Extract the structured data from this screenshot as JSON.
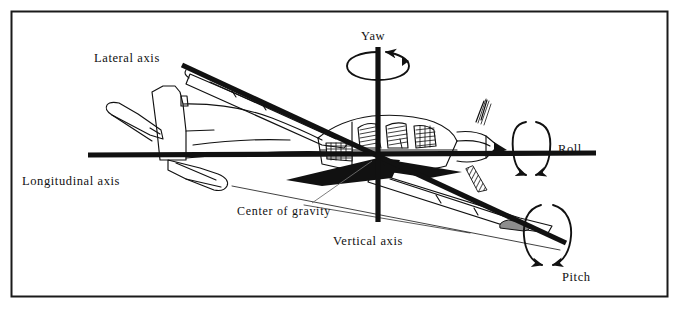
{
  "figure": {
    "kind": "aircraft-axes-diagram",
    "border_color": "#1a1a1a",
    "ink_color": "#111111",
    "background_color": "#ffffff"
  },
  "labels": {
    "lateral_axis": "Lateral axis",
    "longitudinal_axis": "Longitudinal axis",
    "vertical_axis": "Vertical axis",
    "center_of_gravity": "Center of gravity",
    "yaw": "Yaw",
    "roll": "Roll",
    "pitch": "Pitch"
  },
  "axes": [
    {
      "name": "lateral",
      "label": "Lateral axis",
      "rotation": "Pitch",
      "x1": 182,
      "y1": 65,
      "x2": 566,
      "y2": 243
    },
    {
      "name": "longitudinal",
      "label": "Longitudinal axis",
      "rotation": "Roll",
      "x1": 88,
      "y1": 155,
      "x2": 596,
      "y2": 153
    },
    {
      "name": "vertical",
      "label": "Vertical axis",
      "rotation": "Yaw",
      "x1": 378,
      "y1": 47,
      "x2": 378,
      "y2": 222
    }
  ],
  "rotation_markers": [
    {
      "name": "yaw",
      "label": "Yaw",
      "cx": 378,
      "cy": 66,
      "rx": 31,
      "ry": 14,
      "label_x": 384,
      "label_y": 40
    },
    {
      "name": "roll",
      "label": "Roll",
      "cx": 531,
      "cy": 147,
      "rx": 19,
      "ry": 28,
      "label_x": 558,
      "label_y": 153
    },
    {
      "name": "pitch",
      "label": "Pitch",
      "cx": 548,
      "cy": 234,
      "rx": 23,
      "ry": 31,
      "label_x": 566,
      "label_y": 281
    }
  ],
  "center_of_gravity": {
    "label": "Center of gravity",
    "point_x": 378,
    "point_y": 155,
    "leader_x1": 312,
    "leader_y1": 203,
    "leader_x2": 370,
    "leader_y2": 162,
    "label_x": 237,
    "label_y": 215
  },
  "label_positions": {
    "lateral_axis": {
      "x": 94,
      "y": 62
    },
    "longitudinal_axis": {
      "x": 22,
      "y": 185
    },
    "vertical_axis": {
      "x": 333,
      "y": 245
    }
  }
}
